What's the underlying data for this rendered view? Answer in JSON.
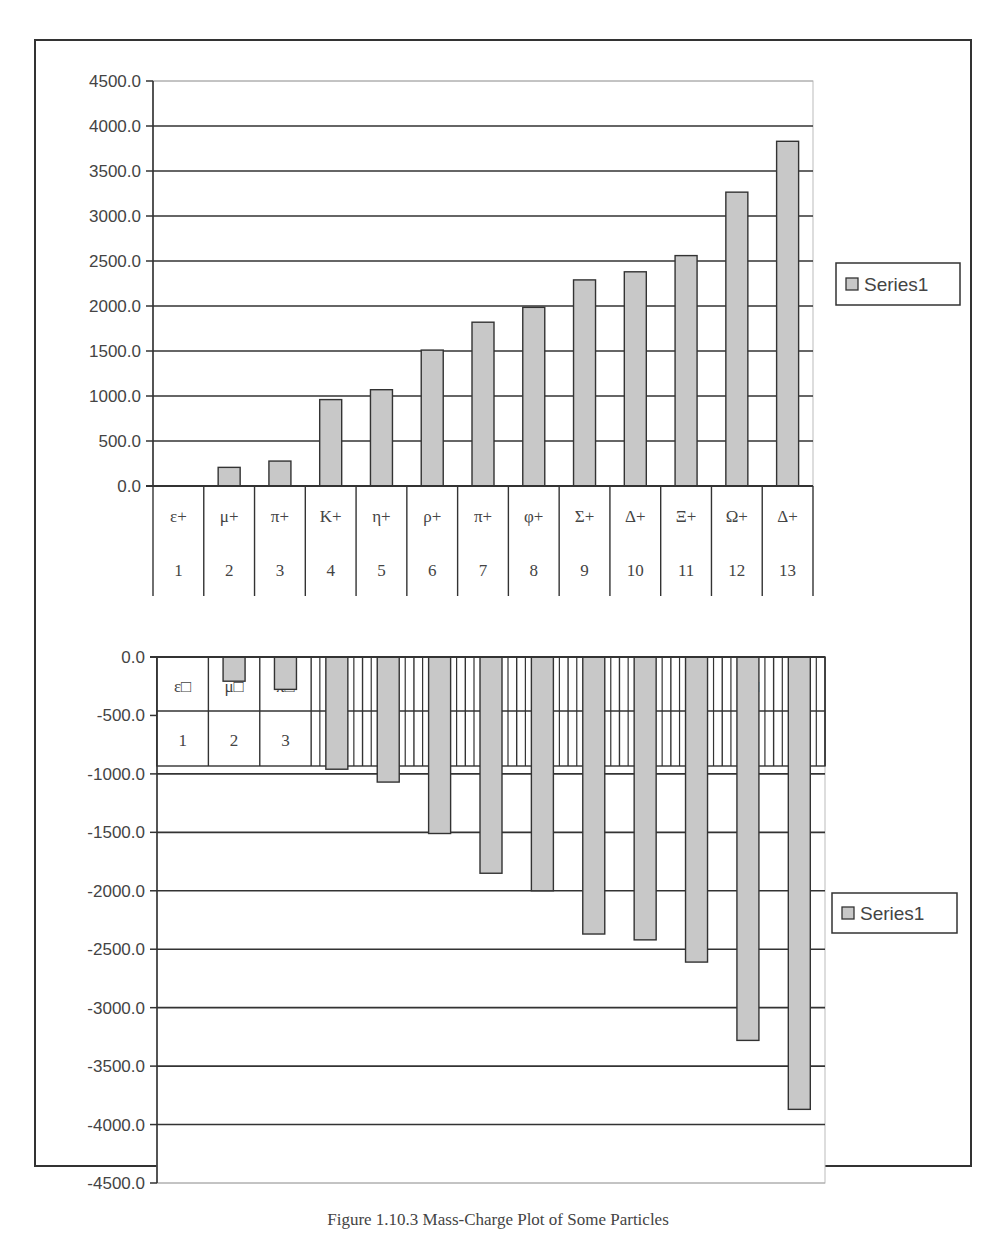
{
  "figure": {
    "caption": "Figure 1.10.3 Mass-Charge Plot of Some Particles"
  },
  "colors": {
    "bar_fill": "#c8c8c8",
    "bar_stroke": "#333333",
    "grid": "#333333",
    "axis_text": "#444444",
    "frame": "#333333"
  },
  "chart_data": [
    {
      "type": "bar",
      "title": "",
      "xlabel": "",
      "ylabel": "",
      "ylim": [
        0,
        4500
      ],
      "yticks": [
        "4500.0",
        "4000.0",
        "3500.0",
        "3000.0",
        "2500.0",
        "2000.0",
        "1500.0",
        "1000.0",
        "500.0",
        "0.0"
      ],
      "ytick_values": [
        4500,
        4000,
        3500,
        3000,
        2500,
        2000,
        1500,
        1000,
        500,
        0
      ],
      "grid": true,
      "legend_position": "right",
      "categories": [
        "1",
        "2",
        "3",
        "4",
        "5",
        "6",
        "7",
        "8",
        "9",
        "10",
        "11",
        "12",
        "13"
      ],
      "category_labels": [
        "ε+",
        "μ+",
        "π+",
        "K+",
        "η+",
        "ρ+",
        "π+",
        "φ+",
        "Σ+",
        "Δ+",
        "Ξ+",
        "Ω+",
        "Δ+"
      ],
      "series": [
        {
          "name": "Series1",
          "values": [
            0,
            207,
            277,
            960,
            1070,
            1510,
            1820,
            1985,
            2290,
            2380,
            2560,
            3265,
            3830
          ]
        }
      ]
    },
    {
      "type": "bar",
      "title": "",
      "xlabel": "",
      "ylabel": "",
      "ylim": [
        -4500,
        0
      ],
      "yticks": [
        "0.0",
        "-500.0",
        "-1000.0",
        "-1500.0",
        "-2000.0",
        "-2500.0",
        "-3000.0",
        "-3500.0",
        "-4000.0",
        "-4500.0"
      ],
      "ytick_values": [
        0,
        -500,
        -1000,
        -1500,
        -2000,
        -2500,
        -3000,
        -3500,
        -4000,
        -4500
      ],
      "grid": true,
      "legend_position": "right",
      "categories": [
        "1",
        "2",
        "3",
        "4",
        "5",
        "6",
        "7",
        "8",
        "9",
        "10",
        "11",
        "12",
        "13"
      ],
      "category_labels": [
        "ε□",
        "μ□",
        "π□",
        "K−",
        "η−",
        "ρ−",
        "π□",
        "φ−",
        "Σ□",
        "Δ−",
        "Ξ□",
        "Ω□",
        "Δ−"
      ],
      "series": [
        {
          "name": "Series1",
          "values": [
            0,
            -207,
            -277,
            -960,
            -1070,
            -1510,
            -1850,
            -2000,
            -2370,
            -2420,
            -2610,
            -3280,
            -3870
          ]
        }
      ]
    }
  ]
}
